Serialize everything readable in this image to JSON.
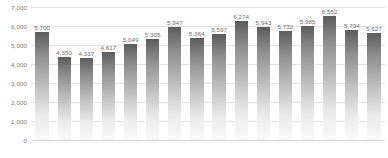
{
  "chart_data": {
    "type": "bar",
    "title": "",
    "xlabel": "",
    "ylabel": "",
    "ylim": [
      0,
      7000
    ],
    "grid": true,
    "legend": false,
    "y_ticks": [
      "0",
      "1,000",
      "2,000",
      "3,000",
      "4,000",
      "5,000",
      "6,000",
      "7,000"
    ],
    "y_tick_values": [
      0,
      1000,
      2000,
      3000,
      4000,
      5000,
      6000,
      7000
    ],
    "categories": [
      "",
      "",
      "",
      "",
      "",
      "",
      "",
      "",
      "",
      "",
      "",
      "",
      "",
      "",
      "",
      ""
    ],
    "values": [
      5700,
      4350,
      4337,
      4617,
      5049,
      5305,
      5947,
      5364,
      5597,
      6274,
      5943,
      5732,
      5985,
      6552,
      5794,
      5627
    ],
    "data_labels": [
      "5,700",
      "4,350",
      "4,337",
      "4,617",
      "5,049",
      "5,305",
      "5,947",
      "5,364",
      "5,597",
      "6,274",
      "5,943",
      "5,732",
      "5,985",
      "6,552",
      "5,794",
      "5,627"
    ],
    "series": [
      {
        "name": "",
        "values": [
          5700,
          4350,
          4337,
          4617,
          5049,
          5305,
          5947,
          5364,
          5597,
          6274,
          5943,
          5732,
          5985,
          6552,
          5794,
          5627
        ]
      }
    ],
    "colors": {
      "bar_top": "#5c5c5c",
      "bar_bottom": "#fafafa",
      "gridline": "#e3e3e3",
      "axis_text": "#7a7a7a",
      "label_text": "#6e6e6e",
      "background": "#ffffff"
    }
  }
}
